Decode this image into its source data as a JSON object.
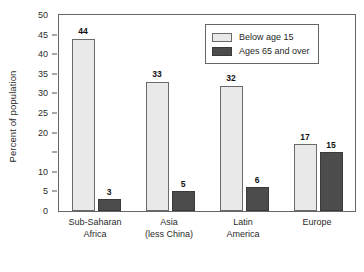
{
  "chart_data": {
    "type": "bar",
    "title": "",
    "xlabel": "",
    "ylabel": "Percent of population",
    "ylim": [
      0,
      50
    ],
    "yticks": [
      0,
      5,
      10,
      15,
      20,
      25,
      30,
      35,
      40,
      45,
      50
    ],
    "ytick_labels": [
      "0",
      "5",
      "10",
      "",
      "20",
      "25",
      "30",
      "35",
      "40",
      "45",
      "50"
    ],
    "grid": false,
    "legend_position": "top-right",
    "categories": [
      {
        "line1": "Sub-Saharan",
        "line2": "Africa"
      },
      {
        "line1": "Asia",
        "line2": "(less China)"
      },
      {
        "line1": "Latin",
        "line2": "America"
      },
      {
        "line1": "Europe",
        "line2": ""
      }
    ],
    "series": [
      {
        "name": "Below age 15",
        "color": "#e9e9e9",
        "values": [
          44,
          33,
          32,
          17
        ],
        "labels": [
          "44",
          "33",
          "32",
          "17"
        ]
      },
      {
        "name": "Ages 65 and over",
        "color": "#4c4c4c",
        "values": [
          3,
          5,
          6,
          15
        ],
        "labels": [
          "3",
          "5",
          "6",
          "15"
        ]
      }
    ]
  },
  "legend": {
    "entries": [
      {
        "label": "Below age 15"
      },
      {
        "label": "Ages 65 and over"
      }
    ]
  }
}
